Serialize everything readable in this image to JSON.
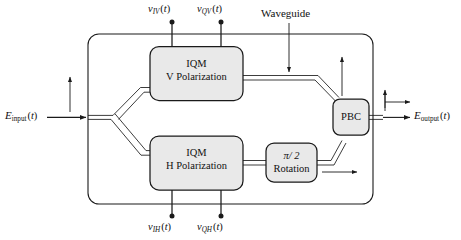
{
  "figure": {
    "background_color": "#ffffff",
    "line_color": "#1a1a1a",
    "box_fill_color": "#e9e9e9",
    "box_stroke_color": "#1a1a1a"
  },
  "blocks": [
    {
      "id": "iqm-v",
      "line1": "IQM",
      "line2": "V Polarization"
    },
    {
      "id": "iqm-h",
      "line1": "IQM",
      "line2": "H Polarization"
    },
    {
      "id": "rotation",
      "line1": "π/ 2",
      "line2": "Rotation"
    },
    {
      "id": "pbc",
      "line1": "PBC",
      "line2": ""
    }
  ],
  "signals": {
    "input": {
      "symbol": "E",
      "subscript": "input",
      "arg": "(t)",
      "full": "E_input(t)"
    },
    "output": {
      "symbol": "E",
      "subscript": "output",
      "arg": "(t)",
      "full": "E_output(t)"
    },
    "drives_top": [
      {
        "symbol": "v",
        "subscript": "IV",
        "arg": "(t)",
        "full": "v_IV(t)"
      },
      {
        "symbol": "v",
        "subscript": "QV",
        "arg": "(t)",
        "full": "v_QV(t)"
      }
    ],
    "drives_bottom": [
      {
        "symbol": "v",
        "subscript": "IH",
        "arg": "(t)",
        "full": "v_IH(t)"
      },
      {
        "symbol": "v",
        "subscript": "QH",
        "arg": "(t)",
        "full": "v_QH(t)"
      }
    ]
  },
  "annotations": {
    "waveguide_label": "Waveguide"
  }
}
